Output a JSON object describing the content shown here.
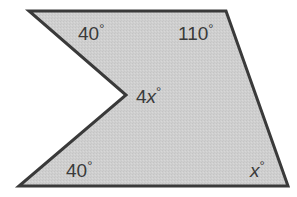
{
  "figure": {
    "type": "concave pentagon",
    "fill_color": "#cfcfcf",
    "stroke_color": "#3a3a3a",
    "vertices": {
      "top_left": [
        29,
        11
      ],
      "top_right": [
        226,
        11
      ],
      "bottom_right": [
        288,
        186
      ],
      "bottom_left": [
        19,
        186
      ],
      "reflex": [
        126,
        95
      ]
    }
  },
  "labels": {
    "top_left_angle": {
      "value": "40",
      "degree": "°"
    },
    "top_right_angle": {
      "value": "110",
      "degree": "°"
    },
    "reflex_angle": {
      "coef": "4",
      "var": "x",
      "degree": "°"
    },
    "bottom_left_angle": {
      "value": "40",
      "degree": "°"
    },
    "bottom_right_angle": {
      "var": "x",
      "degree": "°"
    }
  }
}
